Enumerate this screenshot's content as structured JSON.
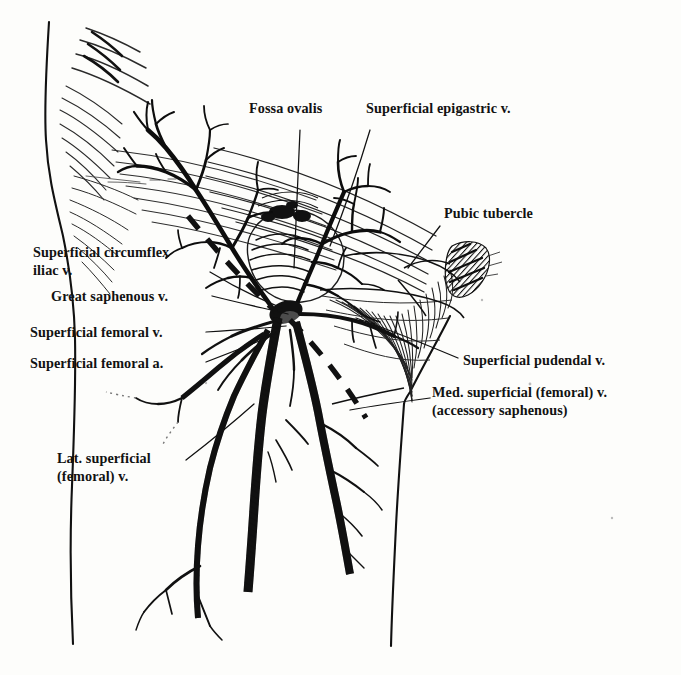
{
  "figure": {
    "ink_color": "#111111",
    "paper_color": "#fdfdfb",
    "width": 681,
    "height": 675
  },
  "labels": {
    "fossa_ovalis": "Fossa ovalis",
    "superficial_epigastric": "Superficial epigastric v.",
    "pubic_tubercle": "Pubic tubercle",
    "superficial_circumflex_iliac_1": "Superficial circumflex",
    "superficial_circumflex_iliac_2": "iliac v.",
    "great_saphenous": "Great saphenous v.",
    "superficial_femoral_v": "Superficial femoral v.",
    "superficial_femoral_a": "Superficial femoral a.",
    "superficial_pudendal": "Superficial pudendal v.",
    "med_superficial_1": "Med. superficial (femoral) v.",
    "med_superficial_2": "(accessory saphenous)",
    "lat_superficial_1": "Lat. superficial",
    "lat_superficial_2": "(femoral) v."
  },
  "structures": [
    {
      "name": "thigh-outline",
      "kind": "contour"
    },
    {
      "name": "inguinal-ligament-hatching",
      "kind": "hatching"
    },
    {
      "name": "fossa-ovalis-opening",
      "kind": "opening"
    },
    {
      "name": "pubic-tubercle-mass",
      "kind": "hatched-wedge"
    },
    {
      "name": "great-saphenous-vein",
      "kind": "vessel"
    },
    {
      "name": "superficial-circumflex-iliac-vein",
      "kind": "vessel-tree"
    },
    {
      "name": "superficial-epigastric-vein",
      "kind": "vessel-tree"
    },
    {
      "name": "superficial-pudendal-vein",
      "kind": "vessel"
    },
    {
      "name": "medial-superficial-femoral-vein",
      "kind": "vessel"
    },
    {
      "name": "lateral-superficial-femoral-vein",
      "kind": "vessel"
    },
    {
      "name": "superficial-femoral-artery",
      "kind": "vessel"
    },
    {
      "name": "dashed-incision-line",
      "kind": "dashed-guide"
    }
  ]
}
